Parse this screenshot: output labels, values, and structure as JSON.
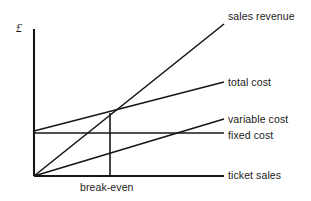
{
  "figure": {
    "title": "",
    "axis_unit_label": "£",
    "background_color": "#ffffff",
    "line_color": "#161616"
  },
  "labels": {
    "sales_revenue": "sales revenue",
    "total_cost": "total cost",
    "variable_cost": "variable cost",
    "fixed_cost": "fixed cost",
    "ticket_sales": "ticket sales",
    "break_even": "break-even"
  },
  "chart_data": {
    "type": "line",
    "title": "",
    "xlabel": "ticket sales",
    "ylabel": "£",
    "xlim": [
      0,
      100
    ],
    "ylim": [
      0,
      100
    ],
    "grid": false,
    "legend_position": "right-inline",
    "annotations": [
      {
        "name": "break-even",
        "text": "break-even",
        "x": 40,
        "y": 0,
        "marker": "vertical-drop-line",
        "from_y": 43,
        "to_y": 0
      },
      {
        "name": "break-even-point",
        "text": "",
        "x": 40,
        "y": 43,
        "marker": "intersection"
      }
    ],
    "x": [
      0,
      100
    ],
    "series": [
      {
        "name": "sales revenue",
        "label": "sales revenue",
        "values": [
          0,
          103
        ],
        "intercept": 0,
        "slope": 1.03,
        "style": "solid"
      },
      {
        "name": "total cost",
        "label": "total cost",
        "values": [
          30,
          64
        ],
        "intercept": 30,
        "slope": 0.34,
        "style": "solid"
      },
      {
        "name": "variable cost",
        "label": "variable cost",
        "values": [
          0,
          39
        ],
        "intercept": 0,
        "slope": 0.39,
        "style": "solid"
      },
      {
        "name": "fixed cost",
        "label": "fixed cost",
        "values": [
          29,
          29
        ],
        "intercept": 29,
        "slope": 0,
        "style": "solid"
      }
    ]
  },
  "geometry": {
    "origin": {
      "x": 34,
      "y": 176
    },
    "y_axis_top": {
      "x": 34,
      "y": 29
    },
    "x_axis_end": {
      "x": 224,
      "y": 176
    },
    "sales_revenue_end": {
      "x": 224,
      "y": 24
    },
    "total_cost_start": {
      "x": 34,
      "y": 131
    },
    "total_cost_end": {
      "x": 224,
      "y": 82
    },
    "variable_cost_end": {
      "x": 224,
      "y": 119
    },
    "fixed_cost_y": 133,
    "break_even_x": 110,
    "break_even_y": 113
  }
}
